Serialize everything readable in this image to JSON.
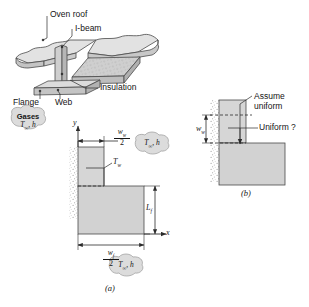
{
  "figure": {
    "colors": {
      "fill_light": "#d9d9d9",
      "fill_mid": "#c9c9c9",
      "fill_dark": "#b5b5b5",
      "stroke": "#3a3a3a",
      "text": "#151515",
      "cloud_fill": "#dcdcdc",
      "wall_stipple": "#a8a8a8"
    }
  },
  "isometric": {
    "labels": {
      "oven_roof": "Oven roof",
      "i_beam": "I-beam",
      "insulation": "Insulation",
      "flange": "Flange",
      "web": "Web"
    }
  },
  "diagram_a": {
    "caption": "(a)",
    "axes": {
      "y": "y",
      "x": "x"
    },
    "web_width": {
      "numerator": "w",
      "numerator_sub": "w",
      "denominator": "2"
    },
    "flange_width": {
      "numerator": "w",
      "numerator_sub": "f",
      "denominator": "2"
    },
    "flange_length": {
      "symbol": "L",
      "sub": "f"
    },
    "wall_temp": {
      "symbol": "T",
      "sub": "w"
    },
    "clouds": [
      {
        "name": "gases-cloud",
        "line1": "Gases",
        "line2": "T",
        "sub": "∞",
        "line2_rest": ", h"
      },
      {
        "name": "ambient-cloud-right",
        "line1": "",
        "line2": "T",
        "sub": "∞",
        "line2_rest": ", h"
      },
      {
        "name": "ambient-cloud-bottom",
        "line1": "",
        "line2": "T",
        "sub": "∞",
        "line2_rest": ", h"
      }
    ]
  },
  "diagram_b": {
    "caption": "(b)",
    "assume_uniform": "Assume\nuniform",
    "assume_uniform_line1": "Assume",
    "assume_uniform_line2": "uniform",
    "uniform_question": "Uniform ?",
    "web_width": {
      "symbol": "w",
      "sub": "w"
    }
  }
}
